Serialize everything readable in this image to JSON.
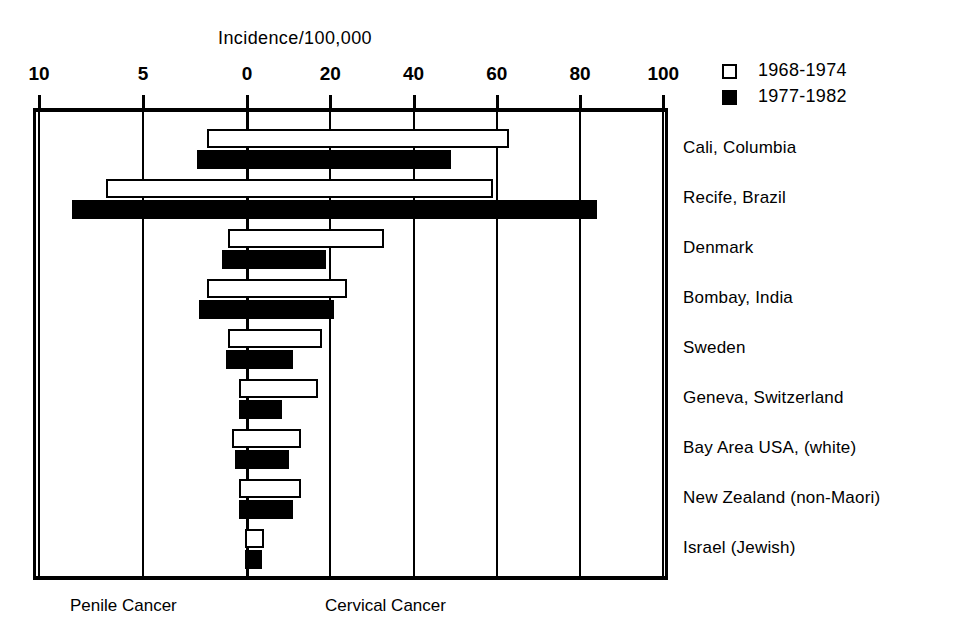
{
  "chart": {
    "axis_title": "Incidence/100,000",
    "footer_left": "Penile Cancer",
    "footer_right": "Cervical Cancer",
    "legend": [
      {
        "key": "period1",
        "label": "1968-1974",
        "style": "open"
      },
      {
        "key": "period2",
        "label": "1977-1982",
        "style": "filled"
      }
    ],
    "tick_labels": [
      "10",
      "5",
      "0",
      "20",
      "40",
      "60",
      "80",
      "100"
    ]
  },
  "chart_data": {
    "type": "bar",
    "title": "Incidence/100,000",
    "orientation": "horizontal",
    "layout": "diverging-dual-axis",
    "xlabel": "Incidence/100,000",
    "ylabel": "",
    "grid": true,
    "legend_position": "top-right",
    "left_axis": {
      "name": "Penile Cancer",
      "ticks": [
        10,
        5,
        0
      ],
      "range": [
        10,
        0
      ],
      "direction": "right-to-left"
    },
    "right_axis": {
      "name": "Cervical Cancer",
      "ticks": [
        0,
        20,
        40,
        60,
        80,
        100
      ],
      "range": [
        0,
        100
      ],
      "direction": "left-to-right"
    },
    "categories": [
      "Cali, Columbia",
      "Recife, Brazil",
      "Denmark",
      "Bombay, India",
      "Sweden",
      "Geneva, Switzerland",
      "Bay Area USA, (white)",
      "New Zealand (non-Maori)",
      "Israel (Jewish)"
    ],
    "series": [
      {
        "name": "1968-1974",
        "style": "open",
        "penile": [
          1.9,
          6.8,
          0.9,
          1.9,
          0.9,
          0.4,
          0.7,
          0.4,
          0.1
        ],
        "cervical": [
          63.0,
          59.0,
          33.0,
          24.0,
          18.0,
          17.0,
          13.0,
          13.0,
          4.0
        ]
      },
      {
        "name": "1977-1982",
        "style": "filled",
        "penile": [
          2.4,
          8.4,
          1.2,
          2.3,
          1.0,
          0.4,
          0.6,
          0.4,
          0.1
        ],
        "cervical": [
          49.0,
          84.0,
          19.0,
          21.0,
          11.0,
          8.5,
          10.0,
          11.0,
          3.5
        ]
      }
    ]
  },
  "geometry": {
    "zero_x": 247,
    "px_per_unit_left": 20.8,
    "px_per_unit_right": 4.1625,
    "plot_top": 112,
    "row_height": 50,
    "first_row_center": 148,
    "bar_height": 19,
    "bar_gap": 2,
    "tick_values": [
      10,
      5,
      0,
      20,
      40,
      60,
      80,
      100
    ],
    "tick_sides": [
      "left",
      "left",
      "zero",
      "right",
      "right",
      "right",
      "right",
      "right"
    ]
  }
}
